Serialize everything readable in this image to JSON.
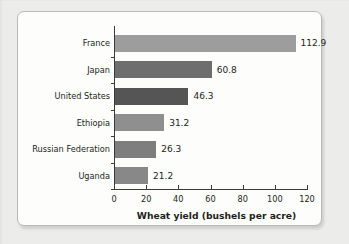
{
  "chart_data": {
    "type": "bar",
    "orientation": "horizontal",
    "title": "",
    "xlabel": "Wheat yield (bushels per acre)",
    "ylabel": "",
    "categories": [
      "France",
      "Japan",
      "United States",
      "Ethiopia",
      "Russian Federation",
      "Uganda"
    ],
    "values": [
      112.9,
      60.8,
      46.3,
      31.2,
      26.3,
      21.2
    ],
    "value_labels": [
      "112.9",
      "60.8",
      "46.3",
      "31.2",
      "26.3",
      "21.2"
    ],
    "bar_colors": [
      "#9d9d9d",
      "#6e6e6e",
      "#555555",
      "#8f8f8f",
      "#7e7e7e",
      "#888888"
    ],
    "xlim": [
      0,
      120
    ],
    "xticks": [
      0,
      20,
      40,
      60,
      80,
      100,
      120
    ],
    "xtick_labels": [
      "0",
      "20",
      "40",
      "60",
      "80",
      "100",
      "120"
    ],
    "grid": false,
    "legend": null
  },
  "figure": {
    "background_color": "#ececeb",
    "card_color": "#fdfdfc",
    "axis_color": "#3a3a3a",
    "text_color": "#231f20"
  }
}
